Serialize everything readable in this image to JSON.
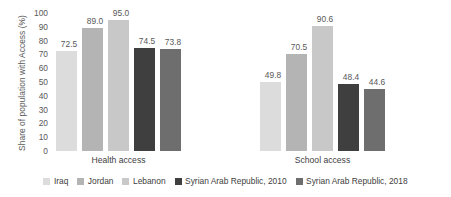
{
  "chart_data": {
    "type": "bar",
    "title": "",
    "xlabel": "",
    "ylabel": "Share of population with Access (%)",
    "ylim": [
      0,
      100
    ],
    "yticks": [
      100,
      90,
      80,
      70,
      60,
      50,
      40,
      30,
      20,
      10,
      0
    ],
    "grid": false,
    "legend_position": "bottom",
    "categories": [
      "Health access",
      "School access"
    ],
    "series": [
      {
        "name": "Iraq",
        "color": "#dcdcdc",
        "values": [
          72.5,
          49.8
        ],
        "labels": [
          "72.5",
          "49.8"
        ]
      },
      {
        "name": "Jordan",
        "color": "#b4b4b4",
        "values": [
          89.0,
          70.5
        ],
        "labels": [
          "89.0",
          "70.5"
        ]
      },
      {
        "name": "Lebanon",
        "color": "#c8c8c8",
        "values": [
          95.0,
          90.6
        ],
        "labels": [
          "95.0",
          "90.6"
        ]
      },
      {
        "name": "Syrian Arab Republic, 2010",
        "color": "#3f3f3f",
        "values": [
          74.5,
          48.4
        ],
        "labels": [
          "74.5",
          "48.4"
        ]
      },
      {
        "name": "Syrian Arab Republic, 2018",
        "color": "#6e6e6e",
        "values": [
          73.8,
          44.6
        ],
        "labels": [
          "73.8",
          "44.6"
        ]
      }
    ]
  }
}
